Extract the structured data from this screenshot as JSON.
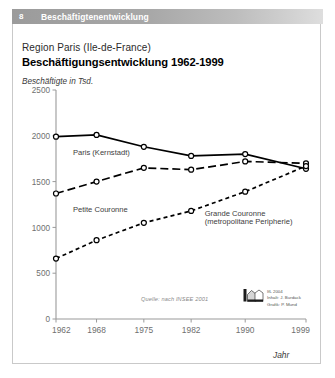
{
  "header": {
    "number": "8",
    "title": "Beschäftigtenentwicklung"
  },
  "titles": {
    "subtitle": "Region Paris (Ile-de-France)",
    "main": "Beschäftigungsentwicklung 1962-1999"
  },
  "source": {
    "note": "Quelle: nach INSEE 2001",
    "credit_line1": "IfL 2004",
    "credit_line2": "Inhalt: J. Burdack",
    "credit_line3": "Grafik: P. Mund"
  },
  "chart_data": {
    "type": "line",
    "title": "Beschäftigungsentwicklung 1962-1999",
    "subtitle": "Region Paris (Ile-de-France)",
    "xlabel": "Jahr",
    "ylabel": "Beschäftigte in Tsd.",
    "x": [
      1962,
      1968,
      1975,
      1982,
      1990,
      1999
    ],
    "xticklabels": [
      "1962",
      "1968",
      "1975",
      "1982",
      "1990",
      "1999"
    ],
    "ylim": [
      0,
      2500
    ],
    "yticks": [
      0,
      500,
      1000,
      1500,
      2000,
      2500
    ],
    "yticklabels": [
      "0",
      "500",
      "1000",
      "1500",
      "2000",
      "2500"
    ],
    "grid": false,
    "legend": "inline-labels",
    "series": [
      {
        "name": "Paris (Kernstadt)",
        "style": "solid",
        "color": "#000000",
        "values": [
          1990,
          2010,
          1880,
          1780,
          1800,
          1640
        ]
      },
      {
        "name": "Petite Couronne",
        "style": "long-dash",
        "color": "#000000",
        "values": [
          1370,
          1500,
          1650,
          1630,
          1720,
          1700
        ]
      },
      {
        "name": "Grande Couronne (metropolitane Peripherie)",
        "style": "short-dash",
        "color": "#000000",
        "values": [
          660,
          860,
          1050,
          1180,
          1390,
          1670
        ]
      }
    ],
    "annotations": [
      {
        "text": "Paris (Kernstadt)",
        "x": 1964.5,
        "y": 1790
      },
      {
        "text": "Petite Couronne",
        "x": 1964.5,
        "y": 1170
      },
      {
        "text": "Grande Couronne",
        "x": 1984.0,
        "y": 1120
      },
      {
        "text": "(metropolitane Peripherie)",
        "x": 1984.0,
        "y": 1035
      }
    ]
  }
}
